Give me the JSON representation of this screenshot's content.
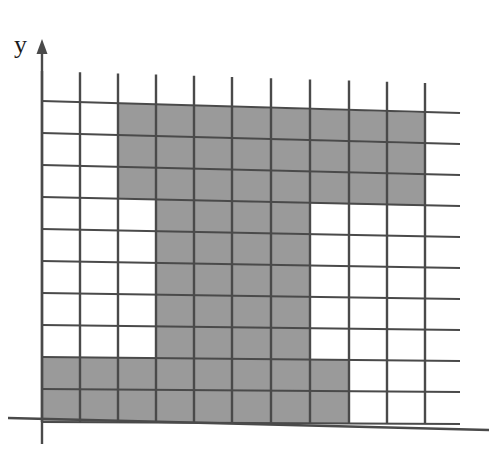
{
  "figure": {
    "kind": "grid-shaded-figure",
    "axes": {
      "y_axis_label": "y",
      "y_axis_arrow": "up-arrow",
      "x_axis_label": "",
      "show_x_axis": true,
      "show_y_axis": true
    },
    "colors": {
      "shaded_cell": "#9a9a9a",
      "grid_line": "#4a4a4a",
      "axis_line": "#4a4a4a",
      "background": "#ffffff",
      "label": "#1a1a1a"
    }
  },
  "chart_data": {
    "type": "heatmap",
    "title": "",
    "subtitle": "",
    "xlabel": "",
    "ylabel": "y",
    "columns": 10,
    "rows": 10,
    "legend": [],
    "annotations": [],
    "grid": true,
    "xlim": [
      0,
      10
    ],
    "ylim": [
      0,
      10
    ],
    "categories": [
      "0",
      "1",
      "2",
      "3",
      "4",
      "5",
      "6",
      "7",
      "8",
      "9"
    ],
    "cell_states_note": "1 = shaded grey, 0 = white. Row 0 is the top row of the grid.",
    "values": [
      [
        0,
        0,
        1,
        1,
        1,
        1,
        1,
        1,
        1,
        1
      ],
      [
        0,
        0,
        1,
        1,
        1,
        1,
        1,
        1,
        1,
        1
      ],
      [
        0,
        0,
        1,
        1,
        1,
        1,
        1,
        1,
        1,
        1
      ],
      [
        0,
        0,
        0,
        1,
        1,
        1,
        1,
        0,
        0,
        0
      ],
      [
        0,
        0,
        0,
        1,
        1,
        1,
        1,
        0,
        0,
        0
      ],
      [
        0,
        0,
        0,
        1,
        1,
        1,
        1,
        0,
        0,
        0
      ],
      [
        0,
        0,
        0,
        1,
        1,
        1,
        1,
        0,
        0,
        0
      ],
      [
        0,
        0,
        0,
        1,
        1,
        1,
        1,
        0,
        0,
        0
      ],
      [
        1,
        1,
        1,
        1,
        1,
        1,
        1,
        1,
        0,
        0
      ],
      [
        1,
        1,
        1,
        1,
        1,
        1,
        1,
        1,
        0,
        0
      ]
    ],
    "shaded_cell_count": 60,
    "total_cell_count": 100,
    "geometry": {
      "x_gridlines": [
        42,
        80,
        118,
        156,
        194,
        232,
        271,
        310,
        349,
        387,
        425
      ],
      "y_gridlines": [
        113,
        144,
        175,
        206,
        237,
        268,
        299,
        330,
        361,
        392,
        424
      ],
      "column_tick_overshoot_top": 30,
      "row_tick_overshoot_right": 35,
      "x_axis_y": 424,
      "y_axis_x": 42,
      "y_axis_top": 48,
      "y_axis_bottom": 444,
      "x_axis_left": 8,
      "x_axis_right": 489
    }
  }
}
